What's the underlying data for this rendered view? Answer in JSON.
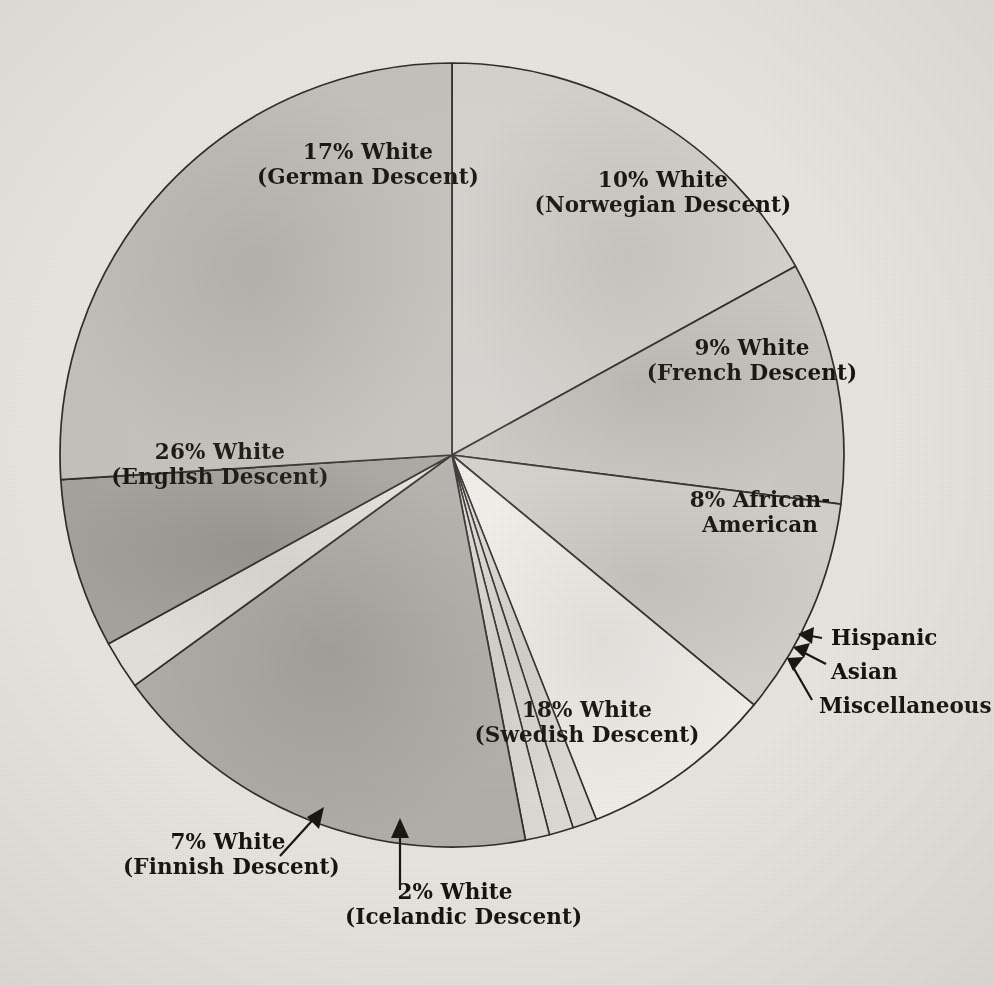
{
  "chart_data": {
    "type": "pie",
    "title": "",
    "subtitle": "",
    "xlabel": "",
    "ylabel": "",
    "legend_position": "none",
    "grid": false,
    "units": "percent",
    "total": 100,
    "start_angle_deg": 0,
    "direction": "clockwise",
    "categories": [
      "17% White (German Descent)",
      "10% White (Norwegian Descent)",
      "9% White (French Descent)",
      "8% African-American",
      "Hispanic",
      "Asian",
      "Miscellaneous",
      "18% White (Swedish Descent)",
      "2% White (Icelandic Descent)",
      "7% White (Finnish Descent)",
      "26% White (English Descent)"
    ],
    "values": [
      17,
      10,
      9,
      8,
      1,
      1,
      1,
      18,
      2,
      7,
      26
    ],
    "slices": [
      {
        "key": "german",
        "line1": "17% White",
        "line2": "(German Descent)",
        "value": 17,
        "label_style": "inside",
        "fill": "#cfcdc8"
      },
      {
        "key": "norwegian",
        "line1": "10% White",
        "line2": "(Norwegian Descent)",
        "value": 10,
        "label_style": "inside",
        "fill": "#c3c1bb"
      },
      {
        "key": "french",
        "line1": "9% White",
        "line2": "(French Descent)",
        "value": 9,
        "label_style": "inside",
        "fill": "#cbc9c3"
      },
      {
        "key": "african-american",
        "line1": "8% African-",
        "line2": "American",
        "value": 8,
        "label_style": "inside",
        "fill": "#ebe9e4"
      },
      {
        "key": "hispanic",
        "line1": "Hispanic",
        "line2": "",
        "value": 1,
        "label_style": "leader",
        "fill": "#d8d6d0"
      },
      {
        "key": "asian",
        "line1": "Asian",
        "line2": "",
        "value": 1,
        "label_style": "leader",
        "fill": "#d8d6d0"
      },
      {
        "key": "miscellaneous",
        "line1": "Miscellaneous",
        "line2": "",
        "value": 1,
        "label_style": "leader",
        "fill": "#d8d6d0"
      },
      {
        "key": "swedish",
        "line1": "18% White",
        "line2": "(Swedish Descent)",
        "value": 18,
        "label_style": "inside",
        "fill": "#a9a7a1"
      },
      {
        "key": "icelandic",
        "line1": "2% White",
        "line2": "(Icelandic Descent)",
        "value": 2,
        "label_style": "arrow",
        "fill": "#dedcd6"
      },
      {
        "key": "finnish",
        "line1": "7% White",
        "line2": "(Finnish Descent)",
        "value": 7,
        "label_style": "arrow",
        "fill": "#9d9b95"
      },
      {
        "key": "english",
        "line1": "26% White",
        "line2": "(English Descent)",
        "value": 26,
        "label_style": "inside",
        "fill": "#bdbbb5"
      }
    ],
    "colors": {
      "background": "#e9e7e2",
      "outline": "#2e2d2b",
      "label_text": "#14130d"
    }
  }
}
